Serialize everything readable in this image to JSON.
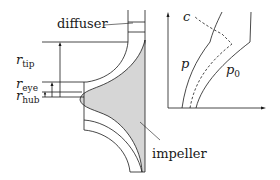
{
  "figure": {
    "left_panel": {
      "title": "Centrifugal compressor meridional section",
      "labels": {
        "diffuser": "diffuser",
        "impeller": "impeller",
        "r_tip_base": "r",
        "r_tip_sub": "tip",
        "r_eye_base": "r",
        "r_eye_sub": "eye",
        "r_hub_base": "r",
        "r_hub_sub": "hub"
      },
      "colors": {
        "impeller_fill": "#d6d6d6",
        "line": "#1a1a1a"
      }
    },
    "right_panel": {
      "labels": {
        "c": "c",
        "p": "p",
        "p0_base": "p",
        "p0_sub": "0"
      },
      "curves": [
        {
          "name": "p",
          "style": "solid"
        },
        {
          "name": "c",
          "style": "dashed"
        },
        {
          "name": "p0",
          "style": "solid"
        }
      ]
    }
  }
}
